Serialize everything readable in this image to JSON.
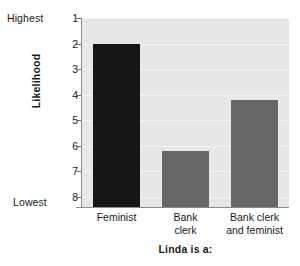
{
  "chart_data": {
    "type": "bar",
    "title": "",
    "subtitle": "",
    "xlabel": "Linda is a:",
    "ylabel": "Likelihood",
    "categories": [
      "Feminist",
      "Bank clerk",
      "Bank clerk and feminist"
    ],
    "category_lines": [
      [
        "Feminist"
      ],
      [
        "Bank",
        "clerk"
      ],
      [
        "Bank clerk",
        "and feminist"
      ]
    ],
    "values": [
      2.0,
      6.2,
      4.2
    ],
    "bar_colors": [
      "#161616",
      "#666666",
      "#666666"
    ],
    "ylim": [
      1,
      8.4
    ],
    "y_inverted": true,
    "yticks": [
      1,
      2,
      3,
      4,
      5,
      6,
      7,
      8
    ],
    "ytick_labels": [
      "1",
      "2",
      "3",
      "4",
      "5",
      "6",
      "7",
      "8"
    ],
    "y_axis_high_label": "Highest",
    "y_axis_low_label": "Lowest",
    "grid": true,
    "legend": "none",
    "plot_background": "#e7e7e7",
    "figure_background": "#ffffff",
    "axis_color": "#8c8c8c"
  }
}
